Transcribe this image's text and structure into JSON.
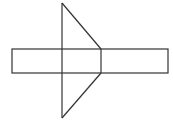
{
  "diagram": {
    "stroke_color": "#333333",
    "background": "#ffffff",
    "shapes": {
      "strip": {
        "x": 12,
        "y": 49,
        "width": 156,
        "height": 24
      },
      "divider_left_x": 62,
      "divider_right_x": 101,
      "top_triangle": [
        [
          62,
          3
        ],
        [
          101,
          49
        ],
        [
          62,
          49
        ]
      ],
      "bottom_triangle": [
        [
          62,
          73
        ],
        [
          101,
          73
        ],
        [
          62,
          118
        ]
      ]
    }
  }
}
